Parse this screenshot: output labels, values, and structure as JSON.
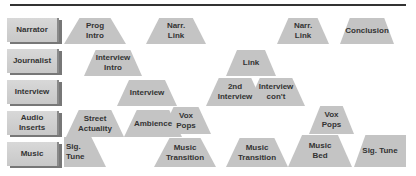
{
  "rows": [
    {
      "label": "Narrator"
    },
    {
      "label": "Journalist"
    },
    {
      "label": "Interview"
    },
    {
      "label": "Audio\nInserts"
    },
    {
      "label": "Music"
    }
  ],
  "blocks": [
    {
      "text": "Prog\nIntro",
      "row": "Narrator"
    },
    {
      "text": "Narr.\nLink",
      "row": "Narrator"
    },
    {
      "text": "Narr.\nLink",
      "row": "Narrator"
    },
    {
      "text": "Conclusion",
      "row": "Narrator"
    },
    {
      "text": "Interview\nIntro",
      "row": "Journalist"
    },
    {
      "text": "Link",
      "row": "Journalist"
    },
    {
      "text": "Interview",
      "row": "Interview"
    },
    {
      "text": "2nd\nInterview",
      "row": "Interview"
    },
    {
      "text": "Interview\ncon't",
      "row": "Interview"
    },
    {
      "text": "Street\nActuality",
      "row": "Audio Inserts"
    },
    {
      "text": "Ambience",
      "row": "Audio Inserts"
    },
    {
      "text": "Vox\nPops",
      "row": "Audio Inserts"
    },
    {
      "text": "Vox\nPops",
      "row": "Audio Inserts"
    },
    {
      "text": "Sig.\nTune",
      "row": "Music"
    },
    {
      "text": "Music\nTransition",
      "row": "Music"
    },
    {
      "text": "Music\nTransition",
      "row": "Music"
    },
    {
      "text": "Music\nBed",
      "row": "Music"
    },
    {
      "text": "Sig. Tune",
      "row": "Music"
    }
  ],
  "colors": {
    "block_fill": "#c4c4c4",
    "label_fill": "#d4d4d4",
    "line": "#333333"
  }
}
